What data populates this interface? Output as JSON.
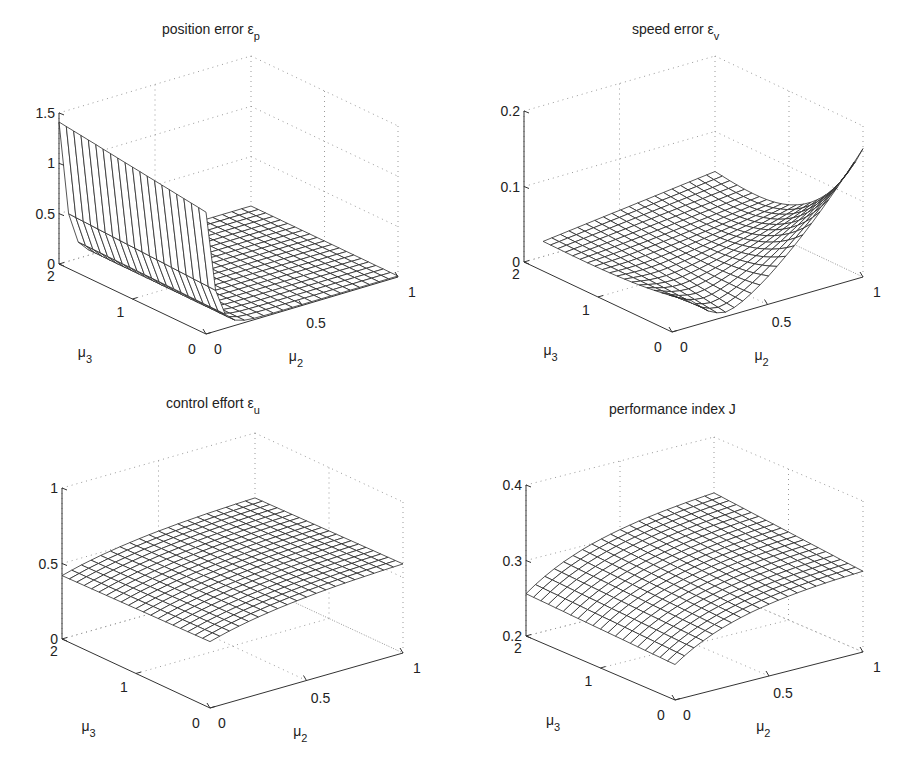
{
  "figure": {
    "panels": [
      {
        "id": "position-error",
        "title": "position  error  ε",
        "title_sub": "p",
        "title_pos": [
          162,
          34
        ],
        "z_ticks": [
          "0",
          "0.5",
          "1",
          "1.5"
        ],
        "z_tick_values": [
          0,
          0.5,
          1,
          1.5
        ],
        "mu3_ticks": [
          "0",
          "1",
          "2"
        ],
        "mu2_ticks": [
          "0",
          "0.5",
          "1"
        ],
        "xlabel": "μ",
        "xlabel_sub": "2",
        "ylabel": "μ",
        "ylabel_sub": "3",
        "proj": {
          "ox": 206,
          "oy": 334,
          "ax": -73.5,
          "ay": -35,
          "bx": 192,
          "by": -57,
          "zpx": 100.7,
          "z0": 0
        },
        "zlim": [
          0,
          1.5
        ],
        "model": "position"
      },
      {
        "id": "speed-error",
        "title": "speed  error  ε",
        "title_sub": "v",
        "title_pos": [
          632,
          34
        ],
        "z_ticks": [
          "0",
          "0.1",
          "0.2"
        ],
        "z_tick_values": [
          0,
          0.1,
          0.2
        ],
        "mu3_ticks": [
          "0",
          "1",
          "2"
        ],
        "mu2_ticks": [
          "0",
          "0.5",
          "1"
        ],
        "xlabel": "μ",
        "xlabel_sub": "2",
        "ylabel": "μ",
        "ylabel_sub": "3",
        "proj": {
          "ox": 672,
          "oy": 332,
          "ax": -74,
          "ay": -35,
          "bx": 191,
          "by": -55,
          "zpx": 755,
          "z0": 0
        },
        "zlim": [
          0,
          0.2
        ],
        "model": "speed"
      },
      {
        "id": "control-effort",
        "title": "control  effort  ε",
        "title_sub": "u",
        "title_pos": [
          166,
          408
        ],
        "z_ticks": [
          "0",
          "0.5",
          "1"
        ],
        "z_tick_values": [
          0,
          0.5,
          1
        ],
        "mu3_ticks": [
          "0",
          "1",
          "2"
        ],
        "mu2_ticks": [
          "0",
          "0.5",
          "1"
        ],
        "xlabel": "μ",
        "xlabel_sub": "2",
        "ylabel": "μ",
        "ylabel_sub": "3",
        "proj": {
          "ox": 210,
          "oy": 708,
          "ax": -74,
          "ay": -34.5,
          "bx": 193,
          "by": -55,
          "zpx": 151,
          "z0": 0
        },
        "zlim": [
          0,
          1
        ],
        "model": "control"
      },
      {
        "id": "performance-index",
        "title": "performance  index  J",
        "title_sub": "",
        "title_pos": [
          609,
          414
        ],
        "z_ticks": [
          "0.2",
          "0.3",
          "0.4"
        ],
        "z_tick_values": [
          0.2,
          0.3,
          0.4
        ],
        "mu3_ticks": [
          "0",
          "1",
          "2"
        ],
        "mu2_ticks": [
          "0",
          "0.5",
          "1"
        ],
        "xlabel": "μ",
        "xlabel_sub": "2",
        "ylabel": "μ",
        "ylabel_sub": "3",
        "proj": {
          "ox": 675,
          "oy": 700,
          "ax": -74.5,
          "ay": -32,
          "bx": 188,
          "by": -48,
          "zpx": 755,
          "z0": 0.2
        },
        "zlim": [
          0.2,
          0.4
        ],
        "model": "perf"
      }
    ]
  },
  "chart_data": [
    {
      "type": "surface",
      "title": "position error ε_p",
      "xlabel": "μ2",
      "ylabel": "μ3",
      "zlabel": "ε_p",
      "xlim": [
        0,
        1
      ],
      "ylim": [
        0,
        2
      ],
      "zlim": [
        0,
        1.5
      ],
      "x_ticks": [
        0,
        0.5,
        1
      ],
      "y_ticks": [
        0,
        1,
        2
      ],
      "z_ticks": [
        0,
        0.5,
        1,
        1.5
      ],
      "grid": true,
      "description": "Large ridge along μ2≈0 (≈1.2 at μ3=0 up to ≈1.4 at μ3=2), dropping steeply to ≈0 for μ2>0.1; flat ≈0 elsewhere",
      "samples": {
        "mu2": [
          0,
          0.05,
          0.1,
          0.25,
          0.5,
          0.75,
          1.0
        ],
        "mu3_0": [
          1.2,
          0.45,
          0.12,
          0.02,
          0.01,
          0.01,
          0.01
        ],
        "mu3_1": [
          1.3,
          0.5,
          0.13,
          0.02,
          0.01,
          0.01,
          0.01
        ],
        "mu3_2": [
          1.4,
          0.55,
          0.15,
          0.03,
          0.01,
          0.01,
          0.01
        ]
      }
    },
    {
      "type": "surface",
      "title": "speed error ε_v",
      "xlabel": "μ2",
      "ylabel": "μ3",
      "zlabel": "ε_v",
      "xlim": [
        0,
        1
      ],
      "ylim": [
        0,
        2
      ],
      "zlim": [
        0,
        0.2
      ],
      "x_ticks": [
        0,
        0.5,
        1
      ],
      "y_ticks": [
        0,
        1,
        2
      ],
      "z_ticks": [
        0,
        0.1,
        0.2
      ],
      "grid": true,
      "description": "Near-flat ≈0.01–0.04 for most of domain; at low μ3 a trough near μ2≈0.3 then rises to ≈0.17 at μ2=1",
      "samples": {
        "mu2": [
          0.1,
          0.25,
          0.4,
          0.55,
          0.7,
          0.85,
          1.0
        ],
        "mu3_0": [
          0.035,
          0.01,
          0.02,
          0.06,
          0.1,
          0.14,
          0.175
        ],
        "mu3_1": [
          0.02,
          0.02,
          0.03,
          0.04,
          0.05,
          0.06,
          0.07
        ],
        "mu3_2": [
          0.01,
          0.02,
          0.025,
          0.03,
          0.035,
          0.04,
          0.045
        ]
      }
    },
    {
      "type": "surface",
      "title": "control effort ε_u",
      "xlabel": "μ2",
      "ylabel": "μ3",
      "zlabel": "ε_u",
      "xlim": [
        0,
        1
      ],
      "ylim": [
        0,
        2
      ],
      "zlim": [
        0,
        1
      ],
      "x_ticks": [
        0,
        0.5,
        1
      ],
      "y_ticks": [
        0,
        1,
        2
      ],
      "z_ticks": [
        0,
        0.5,
        1
      ],
      "grid": true,
      "description": "Smooth concave surface ≈0.4–0.6",
      "samples": {
        "mu2": [
          0,
          0.25,
          0.5,
          0.75,
          1.0
        ],
        "mu3_0": [
          0.44,
          0.5,
          0.54,
          0.57,
          0.59
        ],
        "mu3_1": [
          0.43,
          0.49,
          0.53,
          0.56,
          0.58
        ],
        "mu3_2": [
          0.42,
          0.48,
          0.52,
          0.55,
          0.57
        ]
      }
    },
    {
      "type": "surface",
      "title": "performance index J",
      "xlabel": "μ2",
      "ylabel": "μ3",
      "zlabel": "J",
      "xlim": [
        0,
        1
      ],
      "ylim": [
        0,
        2
      ],
      "zlim": [
        0.2,
        0.4
      ],
      "x_ticks": [
        0,
        0.5,
        1
      ],
      "y_ticks": [
        0,
        1,
        2
      ],
      "z_ticks": [
        0.2,
        0.3,
        0.4
      ],
      "grid": true,
      "description": "Smooth concave surface rising from ≈0.25 at μ2=0 to ≈0.31–0.33 at μ2=1",
      "samples": {
        "mu2": [
          0,
          0.25,
          0.5,
          0.75,
          1.0
        ],
        "mu3_0": [
          0.247,
          0.275,
          0.292,
          0.302,
          0.307
        ],
        "mu3_1": [
          0.252,
          0.282,
          0.3,
          0.31,
          0.316
        ],
        "mu3_2": [
          0.256,
          0.288,
          0.307,
          0.318,
          0.325
        ]
      }
    }
  ]
}
